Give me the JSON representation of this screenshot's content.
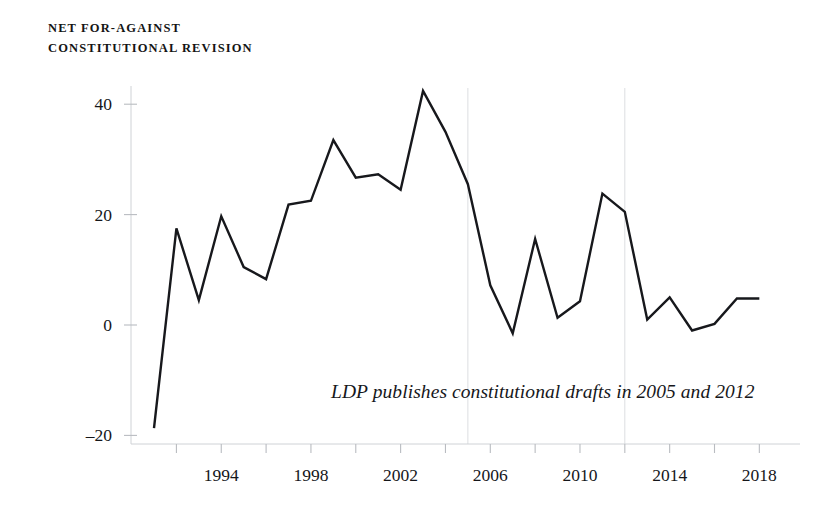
{
  "chart_data": {
    "type": "line",
    "title": "NET FOR-AGAINST\nCONSTITUTIONAL REVISION",
    "title_line1": "NET FOR-AGAINST",
    "title_line2": "CONSTITUTIONAL REVISION",
    "xlabel": "",
    "ylabel": "",
    "ylim": [
      -20,
      45
    ],
    "xlim": [
      1991,
      2018
    ],
    "grid": false,
    "legend": "none",
    "y_ticks": [
      -20,
      0,
      20,
      40
    ],
    "y_tick_labels": [
      "–20",
      "0",
      "20",
      "40"
    ],
    "x_ticks": [
      1992,
      1994,
      1996,
      1998,
      2000,
      2002,
      2004,
      2006,
      2008,
      2010,
      2012,
      2014,
      2016,
      2018
    ],
    "x_tick_labels": [
      "",
      "1994",
      "",
      "1998",
      "",
      "2002",
      "",
      "2006",
      "",
      "2010",
      "",
      "2014",
      "",
      "2018"
    ],
    "x": [
      1991,
      1992,
      1993,
      1994,
      1995,
      1996,
      1997,
      1998,
      1999,
      2000,
      2001,
      2002,
      2003,
      2004,
      2005,
      2006,
      2007,
      2008,
      2009,
      2010,
      2011,
      2012,
      2013,
      2014,
      2015,
      2016,
      2017,
      2018
    ],
    "values": [
      -18.7,
      17.5,
      4.5,
      19.7,
      10.5,
      8.3,
      21.8,
      22.5,
      33.5,
      26.7,
      27.3,
      24.5,
      42.4,
      35.0,
      25.5,
      7.2,
      -1.5,
      15.6,
      1.3,
      4.3,
      23.8,
      20.5,
      1.0,
      5.0,
      -1.0,
      0.2,
      4.8,
      4.8
    ],
    "series": [
      {
        "name": "Net for-against constitutional revision",
        "color": "#17181c",
        "points": [
          {
            "year": 1991,
            "value": -18.7
          },
          {
            "year": 1992,
            "value": 17.5
          },
          {
            "year": 1993,
            "value": 4.5
          },
          {
            "year": 1994,
            "value": 19.7
          },
          {
            "year": 1995,
            "value": 10.5
          },
          {
            "year": 1996,
            "value": 8.3
          },
          {
            "year": 1997,
            "value": 21.8
          },
          {
            "year": 1998,
            "value": 22.5
          },
          {
            "year": 1999,
            "value": 33.5
          },
          {
            "year": 2000,
            "value": 26.7
          },
          {
            "year": 2001,
            "value": 27.3
          },
          {
            "year": 2002,
            "value": 24.5
          },
          {
            "year": 2003,
            "value": 42.4
          },
          {
            "year": 2004,
            "value": 35.0
          },
          {
            "year": 2005,
            "value": 25.5
          },
          {
            "year": 2006,
            "value": 7.2
          },
          {
            "year": 2007,
            "value": -1.5
          },
          {
            "year": 2008,
            "value": 15.6
          },
          {
            "year": 2009,
            "value": 1.3
          },
          {
            "year": 2010,
            "value": 4.3
          },
          {
            "year": 2011,
            "value": 23.8
          },
          {
            "year": 2012,
            "value": 20.5
          },
          {
            "year": 2013,
            "value": 1.0
          },
          {
            "year": 2014,
            "value": 5.0
          },
          {
            "year": 2015,
            "value": -1.0
          },
          {
            "year": 2016,
            "value": 0.2
          },
          {
            "year": 2017,
            "value": 4.8
          },
          {
            "year": 2018,
            "value": 4.8
          }
        ]
      }
    ],
    "event_markers": [
      {
        "year": 2005,
        "label": "LDP constitutional draft 2005"
      },
      {
        "year": 2012,
        "label": "LDP constitutional draft 2012"
      }
    ],
    "annotations": [
      {
        "text": "LDP publishes constitutional drafts in 2005 and 2012",
        "style": "italic"
      }
    ],
    "colors": {
      "line": "#17181c",
      "axis": "#cfd2d6",
      "gridline": "#dcdee1",
      "text": "#15161a",
      "background": "#ffffff"
    }
  }
}
